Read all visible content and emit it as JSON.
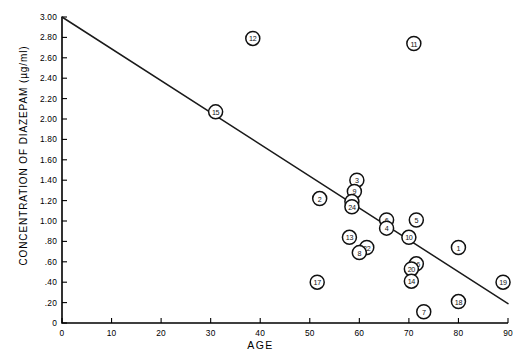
{
  "chart_data": {
    "type": "scatter",
    "title": "",
    "xlabel": "AGE",
    "ylabel": "CONCENTRATION OF DIAZEPAM (µg/ml)",
    "xlim": [
      0,
      90
    ],
    "ylim": [
      0,
      3.0
    ],
    "grid": false,
    "legend": false,
    "xticks": [
      0,
      10,
      20,
      30,
      40,
      50,
      60,
      70,
      80,
      90
    ],
    "xticklabels": [
      "0",
      "10",
      "20",
      "30",
      "40",
      "50",
      "60",
      "70",
      "80",
      "90"
    ],
    "yticks": [
      0,
      0.2,
      0.4,
      0.6,
      0.8,
      1.0,
      1.2,
      1.4,
      1.6,
      1.8,
      2.0,
      2.2,
      2.4,
      2.6,
      2.8,
      3.0
    ],
    "yticklabels": [
      "0",
      ".20",
      ".40",
      ".60",
      ".80",
      "1.00",
      "1.20",
      "1.40",
      "1.60",
      "1.80",
      "2.00",
      "2.20",
      "2.40",
      "2.60",
      "2.80",
      "3.00"
    ],
    "marker_style": "numbered-circle",
    "points": [
      {
        "label": "15",
        "x": 31.0,
        "y": 2.07
      },
      {
        "label": "12",
        "x": 38.5,
        "y": 2.79
      },
      {
        "label": "11",
        "x": 71.0,
        "y": 2.74
      },
      {
        "label": "2",
        "x": 52.0,
        "y": 1.22
      },
      {
        "label": "3",
        "x": 59.5,
        "y": 1.4
      },
      {
        "label": "9",
        "x": 59.0,
        "y": 1.29
      },
      {
        "label": "23",
        "x": 58.5,
        "y": 1.19
      },
      {
        "label": "24",
        "x": 58.5,
        "y": 1.14
      },
      {
        "label": "6",
        "x": 65.5,
        "y": 1.01
      },
      {
        "label": "4",
        "x": 65.5,
        "y": 0.93
      },
      {
        "label": "5",
        "x": 71.5,
        "y": 1.01
      },
      {
        "label": "10",
        "x": 70.0,
        "y": 0.84
      },
      {
        "label": "13",
        "x": 58.0,
        "y": 0.84
      },
      {
        "label": "22",
        "x": 61.5,
        "y": 0.74
      },
      {
        "label": "8",
        "x": 60.0,
        "y": 0.69
      },
      {
        "label": "1",
        "x": 80.0,
        "y": 0.74
      },
      {
        "label": "16",
        "x": 71.5,
        "y": 0.58
      },
      {
        "label": "20",
        "x": 70.5,
        "y": 0.53
      },
      {
        "label": "14",
        "x": 70.5,
        "y": 0.41
      },
      {
        "label": "17",
        "x": 51.5,
        "y": 0.4
      },
      {
        "label": "19",
        "x": 89.0,
        "y": 0.4
      },
      {
        "label": "18",
        "x": 80.0,
        "y": 0.21
      },
      {
        "label": "7",
        "x": 73.0,
        "y": 0.11
      }
    ],
    "regression_line": {
      "x_start": 0.0,
      "y_start": 3.0,
      "x_end": 90.0,
      "y_end": 0.19
    }
  }
}
